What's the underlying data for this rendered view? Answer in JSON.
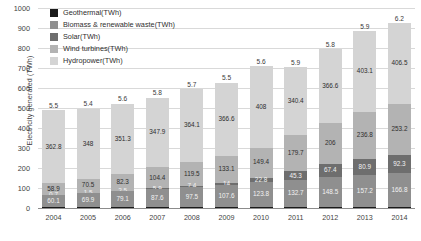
{
  "chart_data": {
    "type": "bar",
    "subtype": "stacked-column",
    "title": "",
    "xlabel": "",
    "ylabel": "Electricity generated (TWh)",
    "ylim": [
      0,
      1000
    ],
    "ytick_step": 100,
    "yticks": [
      "1000",
      "900",
      "800",
      "700",
      "600",
      "500",
      "400",
      "300",
      "200",
      "100",
      "0"
    ],
    "grid": true,
    "legend_position": "top-left-inside",
    "categories": [
      "2004",
      "2005",
      "2006",
      "2007",
      "2008",
      "2009",
      "2010",
      "2011",
      "2012",
      "2013",
      "2014"
    ],
    "series": [
      {
        "name": "Geothermal(TWh)",
        "color": "#1a1a1a",
        "labels_outside": true,
        "values": [
          5.5,
          5.4,
          5.6,
          5.8,
          5.7,
          5.5,
          5.6,
          5.9,
          5.8,
          5.9,
          6.2
        ],
        "value_labels": [
          "5.5",
          "5.4",
          "5.6",
          "5.8",
          "5.7",
          "5.5",
          "5.6",
          "5.9",
          "5.8",
          "5.9",
          "6.2"
        ]
      },
      {
        "name": "Biomass & renewable waste(TWh)",
        "color": "#8f8f8f",
        "values": [
          60.1,
          69.9,
          79.1,
          87.6,
          97.5,
          107.6,
          123.8,
          132.7,
          148.5,
          157.2,
          166.8
        ],
        "value_labels": [
          "60.1",
          "69.9",
          "79.1",
          "87.6",
          "97.5",
          "107.6",
          "123.8",
          "132.7",
          "148.5",
          "157.2",
          "166.8"
        ]
      },
      {
        "name": "Solar(TWh)",
        "color": "#6e6e6e",
        "values": [
          0.7,
          1.5,
          2.5,
          5.9,
          7.4,
          14,
          22.8,
          45.3,
          67.4,
          80.9,
          92.3
        ],
        "value_labels": [
          "0.7",
          "1.5",
          "2.5",
          "5.9",
          "7.4",
          "14",
          "22.8",
          "45.3",
          "67.4",
          "80.9",
          "92.3"
        ]
      },
      {
        "name": "Wind turbines(TWh)",
        "color": "#b3b3b3",
        "values": [
          58.9,
          70.5,
          82.3,
          104.4,
          119.5,
          133.1,
          149.4,
          179.7,
          206,
          236.8,
          253.2
        ],
        "value_labels": [
          "58.9",
          "70.5",
          "82.3",
          "104.4",
          "119.5",
          "133.1",
          "149.4",
          "179.7",
          "206",
          "236.8",
          "253.2"
        ]
      },
      {
        "name": "Hydropower(TWh)",
        "color": "#d4d4d4",
        "values": [
          362.8,
          348,
          351.3,
          347.9,
          364.1,
          366.6,
          408,
          340.4,
          366.6,
          403.1,
          406.5
        ],
        "value_labels": [
          "362.8",
          "348",
          "351.3",
          "347.9",
          "364.1",
          "366.6",
          "408",
          "340.4",
          "366.6",
          "403.1",
          "406.5"
        ]
      }
    ]
  },
  "legend": {
    "items": [
      {
        "label": "Geothermal(TWh)",
        "color": "#1a1a1a"
      },
      {
        "label": "Biomass & renewable waste(TWh)",
        "color": "#8f8f8f"
      },
      {
        "label": "Solar(TWh)",
        "color": "#6e6e6e"
      },
      {
        "label": "Wind turbines(TWh)",
        "color": "#b3b3b3"
      },
      {
        "label": "Hydropower(TWh)",
        "color": "#d4d4d4"
      }
    ]
  }
}
